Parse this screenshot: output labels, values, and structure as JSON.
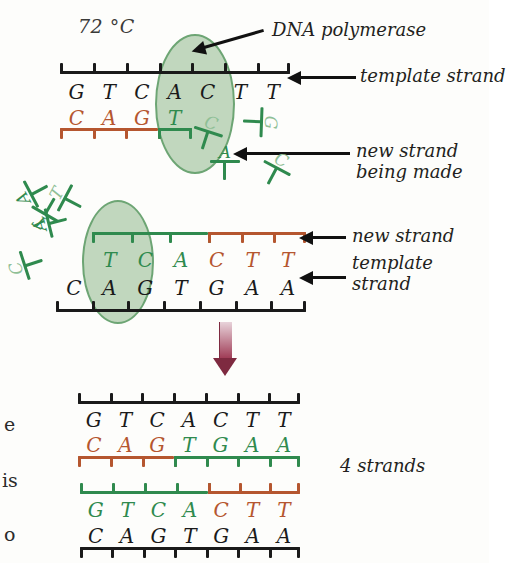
{
  "figure": {
    "temperature": "72 °C",
    "result_label": "4 strands"
  },
  "colors": {
    "template_black": "#1a1a1a",
    "new_strand_green": "#2f8a4e",
    "primer_red": "#b5562f",
    "polymerase_fill": "#b9d2b6",
    "polymerase_stroke": "#5a9a62",
    "arrow_maroon": "#7e2a40"
  },
  "callouts": {
    "dna_polymerase": "DNA polymerase",
    "template_strand": "template strand",
    "new_strand_being_made_line1": "new strand",
    "new_strand_being_made_line2": "being made",
    "new_strand": "new strand",
    "template_line1": "template",
    "template_line2": "strand"
  },
  "edge_fragments": [
    "e",
    "is",
    "o"
  ],
  "panel_top": {
    "name": "extension-in-progress-top",
    "template_bases": [
      "G",
      "T",
      "C",
      "A",
      "C",
      "T",
      "T"
    ],
    "template_color": "black",
    "new_bases": [
      {
        "base": "C",
        "color": "red"
      },
      {
        "base": "A",
        "color": "red"
      },
      {
        "base": "G",
        "color": "red"
      },
      {
        "base": "T",
        "color": "green"
      }
    ],
    "incoming_base": "C",
    "polymerase_present": true
  },
  "panel_middle": {
    "name": "extension-in-progress-bottom",
    "new_bases": [
      {
        "base": "T",
        "color": "green"
      },
      {
        "base": "C",
        "color": "green"
      },
      {
        "base": "A",
        "color": "green"
      },
      {
        "base": "C",
        "color": "red"
      },
      {
        "base": "T",
        "color": "red"
      },
      {
        "base": "T",
        "color": "red"
      }
    ],
    "template_bases": [
      "C",
      "A",
      "G",
      "T",
      "G",
      "A",
      "A"
    ],
    "template_color": "black",
    "polymerase_present": true
  },
  "panel_result": {
    "name": "four-strands-result",
    "duplex_1": {
      "top_bases": [
        "G",
        "T",
        "C",
        "A",
        "C",
        "T",
        "T"
      ],
      "top_color": "black",
      "bottom_bases": [
        {
          "base": "C",
          "color": "red"
        },
        {
          "base": "A",
          "color": "red"
        },
        {
          "base": "G",
          "color": "red"
        },
        {
          "base": "T",
          "color": "green"
        },
        {
          "base": "G",
          "color": "green"
        },
        {
          "base": "A",
          "color": "green"
        },
        {
          "base": "A",
          "color": "green"
        }
      ]
    },
    "duplex_2": {
      "top_bases": [
        {
          "base": "G",
          "color": "green"
        },
        {
          "base": "T",
          "color": "green"
        },
        {
          "base": "C",
          "color": "green"
        },
        {
          "base": "A",
          "color": "green"
        },
        {
          "base": "C",
          "color": "red"
        },
        {
          "base": "T",
          "color": "red"
        },
        {
          "base": "T",
          "color": "red"
        }
      ],
      "bottom_bases": [
        "C",
        "A",
        "G",
        "T",
        "G",
        "A",
        "A"
      ],
      "bottom_color": "black"
    }
  },
  "free_nucleotides": [
    {
      "base": "A",
      "rot": -118,
      "x": 18,
      "y": 178,
      "hollow": false
    },
    {
      "base": "T",
      "rot": -150,
      "x": 30,
      "y": 196,
      "hollow": false
    },
    {
      "base": "T",
      "rot": -62,
      "x": 52,
      "y": 186,
      "hollow": true
    },
    {
      "base": "A",
      "rot": -104,
      "x": 36,
      "y": 208,
      "hollow": false
    },
    {
      "base": "C",
      "rot": -108,
      "x": 12,
      "y": 250,
      "hollow": true
    },
    {
      "base": "G",
      "rot": 92,
      "x": 240,
      "y": 108,
      "hollow": true
    },
    {
      "base": "A",
      "rot": 0,
      "x": 208,
      "y": 152,
      "hollow": false
    },
    {
      "base": "C",
      "rot": 28,
      "x": 258,
      "y": 158,
      "hollow": true
    }
  ]
}
